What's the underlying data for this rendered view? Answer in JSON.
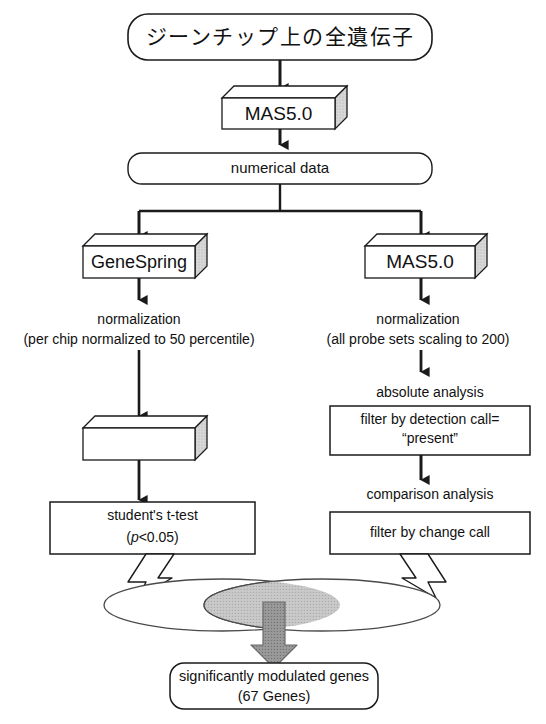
{
  "diagram": {
    "colors": {
      "stroke": "#1a1a1a",
      "text": "#111111",
      "box_face": "#ffffff",
      "box_shade": "#d6d6d6",
      "venn_fill": "#ffffff",
      "venn_overlap": "#c4c4c4",
      "gray_arrow": "#8a8a8a",
      "hollow_arrow": "#ffffff"
    },
    "nodes": {
      "source": {
        "label": "ジーンチップ上の全遺伝子",
        "shape": "rounded-rect"
      },
      "mas5_top": {
        "label": "MAS5.0",
        "shape": "box-3d"
      },
      "numerical_data": {
        "label": "numerical data",
        "shape": "rounded-rect"
      },
      "genespring": {
        "label": "GeneSpring",
        "shape": "box-3d"
      },
      "mas5_right": {
        "label": "MAS5.0",
        "shape": "box-3d"
      },
      "left_normalization": {
        "line1": "normalization",
        "line2": "(per chip normalized to 50 percentile)",
        "shape": "plain-text"
      },
      "right_normalization": {
        "line1": "normalization",
        "line2": "(all probe sets scaling to 200)",
        "shape": "plain-text"
      },
      "excel": {
        "label": "Excel",
        "shape": "box-3d"
      },
      "absolute_analysis": {
        "label": "absolute analysis",
        "shape": "plain-text"
      },
      "detection_filter": {
        "line1": "filter by detection call=",
        "line2": "“present”",
        "shape": "rect"
      },
      "comparison_analysis": {
        "label": "comparison analysis",
        "shape": "plain-text"
      },
      "change_filter": {
        "label": "filter by change call",
        "shape": "rect"
      },
      "t_test": {
        "line1": "student's t-test",
        "line2_prefix": "(",
        "line2_italic": "p",
        "line2_suffix": "<0.05)",
        "shape": "rect"
      },
      "venn": {
        "left_set_label": "",
        "right_set_label": "",
        "overlap_label": "",
        "shape": "venn-two-ellipse"
      },
      "result": {
        "line1": "significantly modulated genes",
        "line2": "(67 Genes)",
        "gene_count": "67",
        "shape": "rounded-rect"
      }
    },
    "edges": [
      {
        "from": "source",
        "to": "mas5_top",
        "style": "solid-arrow"
      },
      {
        "from": "mas5_top",
        "to": "numerical_data",
        "style": "solid-arrow"
      },
      {
        "from": "numerical_data",
        "to": "genespring",
        "style": "solid-arrow-branch-left"
      },
      {
        "from": "numerical_data",
        "to": "mas5_right",
        "style": "solid-arrow-branch-right"
      },
      {
        "from": "genespring",
        "to": "left_normalization",
        "style": "solid-arrow"
      },
      {
        "from": "left_normalization",
        "to": "excel",
        "style": "solid-arrow"
      },
      {
        "from": "excel",
        "to": "t_test",
        "style": "solid-arrow"
      },
      {
        "from": "mas5_right",
        "to": "right_normalization",
        "style": "solid-arrow"
      },
      {
        "from": "right_normalization",
        "to": "absolute_analysis",
        "style": "solid-arrow"
      },
      {
        "from": "detection_filter",
        "to": "comparison_analysis",
        "style": "solid-arrow"
      },
      {
        "from": "t_test",
        "to": "venn",
        "style": "hollow-block-arrow"
      },
      {
        "from": "change_filter",
        "to": "venn",
        "style": "hollow-block-arrow"
      },
      {
        "from": "venn",
        "to": "result",
        "style": "gray-block-arrow"
      }
    ]
  }
}
